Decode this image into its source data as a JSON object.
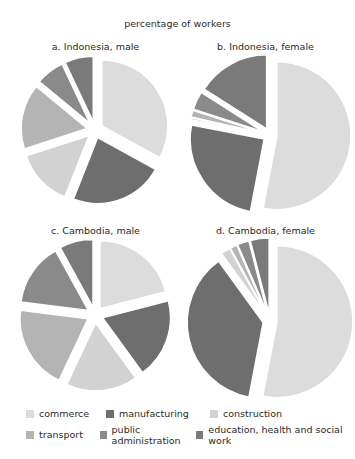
{
  "chart_data": [
    {
      "type": "pie",
      "title": "a. Indonesia, male",
      "categories": [
        "commerce",
        "manufacturing",
        "construction",
        "transport",
        "public administration",
        "education, health and social work"
      ],
      "values": [
        33,
        23,
        14,
        16,
        7,
        7
      ]
    },
    {
      "type": "pie",
      "title": "b. Indonesia, female",
      "categories": [
        "commerce",
        "manufacturing",
        "construction",
        "transport",
        "public administration",
        "education, health and social work"
      ],
      "values": [
        53,
        25,
        0.5,
        1.5,
        4,
        16
      ]
    },
    {
      "type": "pie",
      "title": "c. Cambodia, male",
      "categories": [
        "commerce",
        "manufacturing",
        "construction",
        "transport",
        "public administration",
        "education, health and social work"
      ],
      "values": [
        21,
        19,
        17,
        20,
        15,
        8
      ]
    },
    {
      "type": "pie",
      "title": "d. Cambodia, female",
      "categories": [
        "commerce",
        "manufacturing",
        "construction",
        "transport",
        "public administration",
        "education, health and social work"
      ],
      "values": [
        53,
        37,
        2,
        1.5,
        2.5,
        4
      ]
    }
  ],
  "figure": {
    "title": "percentage of workers",
    "panels": [
      {
        "title": "a. Indonesia, male"
      },
      {
        "title": "b. Indonesia, female"
      },
      {
        "title": "c. Cambodia, male"
      },
      {
        "title": "d. Cambodia, female"
      }
    ]
  },
  "legend": [
    {
      "label": "commerce",
      "color": "#dcdcdc"
    },
    {
      "label": "manufacturing",
      "color": "#6e6e6e"
    },
    {
      "label": "construction",
      "color": "#d2d2d2"
    },
    {
      "label": "transport",
      "color": "#b4b4b4"
    },
    {
      "label": "public administration",
      "color": "#8a8a8a"
    },
    {
      "label": "education, health and social work",
      "color": "#7a7a7a"
    }
  ],
  "slice_colors": [
    "#dcdcdc",
    "#6e6e6e",
    "#d2d2d2",
    "#b4b4b4",
    "#8a8a8a",
    "#7a7a7a"
  ]
}
